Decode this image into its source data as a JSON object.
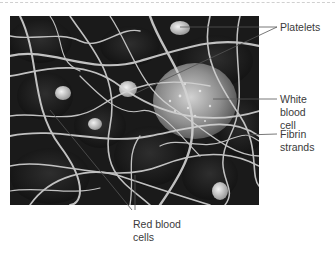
{
  "figure": {
    "labels": [
      {
        "id": "platelets",
        "text": "Platelets"
      },
      {
        "id": "white-blood-cell",
        "text": "White blood\ncell"
      },
      {
        "id": "fibrin-strands",
        "text": "Fibrin\nstrands"
      },
      {
        "id": "red-blood-cells",
        "text": "Red blood\ncells"
      }
    ]
  },
  "colors": {
    "leader_line": "#555555",
    "label_text": "#3a3a3a",
    "background": "#ffffff",
    "micrograph_dark": "#1c1c1c",
    "fibrin": "#d8d8d8"
  }
}
